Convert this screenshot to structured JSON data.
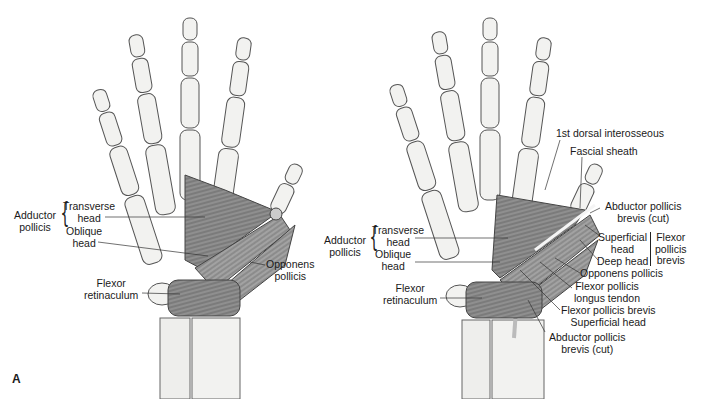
{
  "figure": {
    "panel_letter": "A",
    "left_hand": {
      "group_label": "Adductor pollicis",
      "group_label_lines": [
        "Adductor",
        "pollicis"
      ],
      "labels": {
        "transverse_head": [
          "Transverse",
          "head"
        ],
        "oblique_head": [
          "Oblique",
          "head"
        ],
        "flexor_retinaculum": [
          "Flexor",
          "retinaculum"
        ],
        "opponens_pollicis": [
          "Opponens",
          "pollicis"
        ]
      }
    },
    "right_hand": {
      "group_label_lines": [
        "Adductor",
        "pollicis"
      ],
      "labels": {
        "transverse_head": [
          "Transverse",
          "head"
        ],
        "oblique_head": [
          "Oblique",
          "head"
        ],
        "flexor_retinaculum": [
          "Flexor",
          "retinaculum"
        ],
        "first_dorsal_interosseous": "1st dorsal interosseous",
        "fascial_sheath": "Fascial sheath",
        "abductor_pollicis_brevis_cut_top": [
          "Abductor pollicis",
          "brevis (cut)"
        ],
        "superficial_head": [
          "Superficial",
          "head"
        ],
        "deep_head": "Deep head",
        "flexor_pollicis_brevis": [
          "Flexor",
          "pollicis",
          "brevis"
        ],
        "opponens_pollicis": "Opponens pollicis",
        "flexor_pollicis_longus_tendon": [
          "Flexor pollicis",
          "longus tendon"
        ],
        "fpb_superficial_head": [
          "Flexor pollicis brevis",
          "Superficial head"
        ],
        "abductor_pollicis_brevis_cut_bottom": [
          "Abductor pollicis",
          "brevis (cut)"
        ]
      }
    },
    "colors": {
      "bone_fill": "#f2f2f0",
      "bone_stroke": "#555555",
      "muscle_fill": "#8a8a8a",
      "muscle_dark": "#5e5e5e",
      "line": "#333333"
    }
  }
}
